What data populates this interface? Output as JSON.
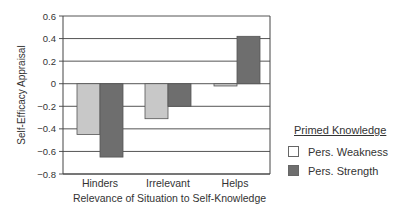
{
  "chart_data": {
    "type": "bar",
    "title": "",
    "xlabel": "Relevance of Situation to Self-Knowledge",
    "ylabel": "Self-Efficacy Appraisal",
    "ylim": [
      -0.8,
      0.6
    ],
    "yticks": [
      0.6,
      0.4,
      0.2,
      0,
      -0.2,
      -0.4,
      -0.6,
      -0.8
    ],
    "ytick_labels": [
      "0.6",
      "0.4",
      "0.2",
      "0",
      "−0.2",
      "−0.4",
      "−0.6",
      "−0.8"
    ],
    "grid": true,
    "categories": [
      "Hinders",
      "Irrelevant",
      "Helps"
    ],
    "series": [
      {
        "name": "Pers. Weakness",
        "color": "#c8c8c8",
        "values": [
          -0.45,
          -0.31,
          -0.02
        ]
      },
      {
        "name": "Pers. Strength",
        "color": "#6e6e6e",
        "values": [
          -0.65,
          -0.2,
          0.42
        ]
      }
    ],
    "legend": {
      "title": "Primed Knowledge",
      "position": "right"
    }
  }
}
